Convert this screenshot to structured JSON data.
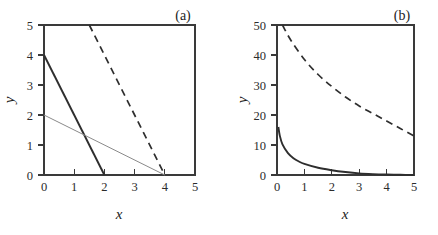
{
  "figure": {
    "width": 438,
    "height": 235,
    "background": "#ffffff",
    "axis_color": "#3a3a3a",
    "curve_color": "#2e2e2e",
    "thin_curve_color": "#8a8a8a"
  },
  "chart_data": [
    {
      "type": "line",
      "panel_label": "(a)",
      "title": "",
      "xlabel": "x",
      "ylabel": "y",
      "xlim": [
        0,
        5
      ],
      "ylim": [
        0,
        5
      ],
      "xticks": [
        0,
        1,
        2,
        3,
        4,
        5
      ],
      "yticks": [
        0,
        1,
        2,
        3,
        4,
        5
      ],
      "xticklabels": [
        "0",
        "1",
        "2",
        "3",
        "4",
        "5"
      ],
      "yticklabels": [
        "0",
        "1",
        "2",
        "3",
        "4",
        "5"
      ],
      "grid": false,
      "legend": "none",
      "series": [
        {
          "name": "steep-solid-line",
          "style": "solid",
          "weight": "thick",
          "color": "#2e2e2e",
          "equation": "y = 4 - 2x",
          "x": [
            0,
            2
          ],
          "values": [
            4,
            0
          ]
        },
        {
          "name": "shallow-solid-line",
          "style": "solid",
          "weight": "thin",
          "color": "#8a8a8a",
          "equation": "y = 2 - 0.5x",
          "x": [
            0,
            4
          ],
          "values": [
            2,
            0
          ]
        },
        {
          "name": "dashed-line",
          "style": "dashed",
          "weight": "thick",
          "color": "#2e2e2e",
          "equation": "y = 8 - 2x",
          "x": [
            1.5,
            4
          ],
          "values": [
            5,
            0
          ]
        }
      ]
    },
    {
      "type": "line",
      "panel_label": "(b)",
      "title": "",
      "xlabel": "x",
      "ylabel": "y",
      "xlim": [
        0,
        5
      ],
      "ylim": [
        0,
        50
      ],
      "xticks": [
        0,
        1,
        2,
        3,
        4,
        5
      ],
      "yticks": [
        0,
        10,
        20,
        30,
        40,
        50
      ],
      "xticklabels": [
        "0",
        "1",
        "2",
        "3",
        "4",
        "5"
      ],
      "yticklabels": [
        "0",
        "10",
        "20",
        "30",
        "40",
        "50"
      ],
      "grid": false,
      "legend": "none",
      "series": [
        {
          "name": "dashed-decay-curve",
          "style": "dashed",
          "weight": "thick",
          "color": "#2e2e2e",
          "description": "slow hyperbolic decay from 50 at x=0.2 to about 13 at x=5",
          "x": [
            0.2,
            0.5,
            1.0,
            1.5,
            2.0,
            2.5,
            3.0,
            3.5,
            4.0,
            4.5,
            5.0
          ],
          "values": [
            50,
            45,
            38.5,
            33.5,
            29.5,
            26,
            23,
            20.5,
            18,
            15.5,
            13
          ]
        },
        {
          "name": "solid-decay-curve",
          "style": "solid",
          "weight": "thick",
          "color": "#2e2e2e",
          "description": "fast hyperbolic decay from 16 at x=0.05 toward 0 near x=5",
          "x": [
            0.05,
            0.1,
            0.2,
            0.4,
            0.6,
            0.8,
            1.0,
            1.5,
            2.0,
            2.5,
            3.0,
            3.5,
            4.0,
            4.5,
            5.0
          ],
          "values": [
            16,
            13.2,
            10.2,
            7.3,
            5.6,
            4.5,
            3.7,
            2.4,
            1.6,
            1.0,
            0.55,
            0.3,
            0.15,
            0.06,
            0.02
          ]
        }
      ]
    }
  ],
  "panel_a": {
    "label": "(a)",
    "xlabel": "x",
    "ylabel": "y",
    "xticklabels": [
      "0",
      "1",
      "2",
      "3",
      "4",
      "5"
    ],
    "yticklabels": [
      "0",
      "1",
      "2",
      "3",
      "4",
      "5"
    ]
  },
  "panel_b": {
    "label": "(b)",
    "xlabel": "x",
    "ylabel": "y",
    "xticklabels": [
      "0",
      "1",
      "2",
      "3",
      "4",
      "5"
    ],
    "yticklabels": [
      "0",
      "10",
      "20",
      "30",
      "40",
      "50"
    ]
  }
}
